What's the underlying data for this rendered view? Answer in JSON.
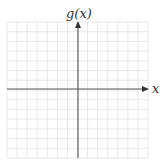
{
  "chart_data": {
    "type": "line",
    "title": "",
    "xlabel": "x",
    "ylabel": "g(x)",
    "series": [],
    "grid": true,
    "grid_cells_x": 14,
    "grid_cells_y": 14,
    "xlim": [
      -7,
      7
    ],
    "ylim": [
      -7,
      7
    ],
    "tick_labels": [],
    "legend": null
  },
  "colors": {
    "grid": "#e2e2e2",
    "axis": "#555555",
    "label": "#333333",
    "background": "#ffffff"
  }
}
